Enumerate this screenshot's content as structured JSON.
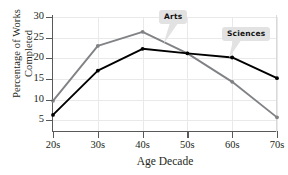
{
  "chart_data": {
    "type": "line",
    "title": "",
    "xlabel": "Age Decade",
    "ylabel_line1": "Percentage of Works",
    "ylabel_line2": "Completed",
    "categories": [
      "20s",
      "30s",
      "40s",
      "50s",
      "60s",
      "70s"
    ],
    "yticks": [
      5,
      10,
      15,
      20,
      25,
      30
    ],
    "ylim": [
      2.4,
      30
    ],
    "grid": true,
    "legend_position": "inline-callouts",
    "series": [
      {
        "name": "Arts",
        "color": "#808285",
        "values": [
          9.7,
          23.0,
          26.4,
          21.2,
          14.3,
          5.7
        ]
      },
      {
        "name": "Sciences",
        "color": "#000000",
        "values": [
          6.3,
          17.0,
          22.3,
          21.2,
          20.2,
          15.2
        ]
      }
    ],
    "annotations": [
      {
        "label": "Arts",
        "target_series": "Arts",
        "target_category": "50s"
      },
      {
        "label": "Sciences",
        "target_series": "Sciences",
        "target_category": "60s"
      }
    ]
  }
}
